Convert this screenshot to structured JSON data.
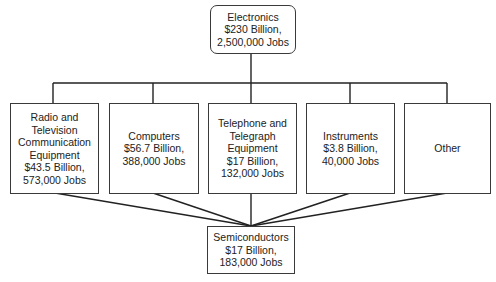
{
  "diagram": {
    "type": "hierarchy",
    "top": {
      "lines": [
        "Electronics",
        "$230 Billion,",
        "2,500,000 Jobs"
      ]
    },
    "middle": [
      {
        "lines": [
          "Radio and",
          "Television",
          "Communication",
          "Equipment",
          "$43.5 Billion,",
          "573,000 Jobs"
        ]
      },
      {
        "lines": [
          "Computers",
          "$56.7 Billion,",
          "388,000 Jobs"
        ]
      },
      {
        "lines": [
          "Telephone and",
          "Telegraph",
          "Equipment",
          "$17 Billion,",
          "132,000 Jobs"
        ]
      },
      {
        "lines": [
          "Instruments",
          "$3.8 Billion,",
          "40,000 Jobs"
        ]
      },
      {
        "lines": [
          "Other"
        ]
      }
    ],
    "bottom": {
      "lines": [
        "Semiconductors",
        "$17 Billion,",
        "183,000 Jobs"
      ]
    },
    "colors": {
      "line": "#222222",
      "border": "#3a3a3a",
      "background": "#ffffff"
    }
  }
}
